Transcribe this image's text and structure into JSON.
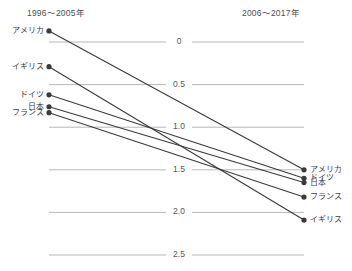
{
  "chart_data": {
    "type": "line",
    "subtype": "slope-chart",
    "title": "",
    "xlabel": "",
    "ylabel": "",
    "categories": [
      "1996〜2005年",
      "2006〜2017年"
    ],
    "ylim": [
      0,
      2.75
    ],
    "yticks": [
      0,
      0.5,
      1.0,
      1.5,
      2.0,
      2.5
    ],
    "ytick_labels": [
      "0",
      "0.5",
      "1.0",
      "1.5",
      "2.0",
      "2.5"
    ],
    "grid": true,
    "legend": "endpoint-labels",
    "series": [
      {
        "name": "アメリカ",
        "values": [
          2.63,
          1.0
        ],
        "color": "#3a3a3a"
      },
      {
        "name": "イギリス",
        "values": [
          2.21,
          0.41
        ],
        "color": "#3a3a3a"
      },
      {
        "name": "ドイツ",
        "values": [
          1.88,
          0.9
        ],
        "color": "#3a3a3a"
      },
      {
        "name": "日本",
        "values": [
          1.74,
          0.85
        ],
        "color": "#3a3a3a"
      },
      {
        "name": "フランス",
        "values": [
          1.67,
          0.68
        ],
        "color": "#3a3a3a"
      }
    ]
  },
  "header": {
    "left_period": "1996〜2005年",
    "right_period": "2006〜2017年"
  },
  "axis": {
    "ticks": [
      {
        "label": "2.5"
      },
      {
        "label": "2.0"
      },
      {
        "label": "1.5"
      },
      {
        "label": "1.0"
      },
      {
        "label": "0.5"
      },
      {
        "label": "0"
      }
    ]
  },
  "left_labels": [
    {
      "name": "アメリカ"
    },
    {
      "name": "イギリス"
    },
    {
      "name": "ドイツ"
    },
    {
      "name": "日本"
    },
    {
      "name": "フランス"
    }
  ],
  "right_labels": [
    {
      "name": "アメリカ"
    },
    {
      "name": "ドイツ"
    },
    {
      "name": "日本"
    },
    {
      "name": "フランス"
    },
    {
      "name": "イギリス"
    }
  ],
  "colors": {
    "line": "#3a3a3a",
    "grid": "#9a9a9a",
    "text": "#4a4a4a",
    "background": "#ffffff"
  }
}
